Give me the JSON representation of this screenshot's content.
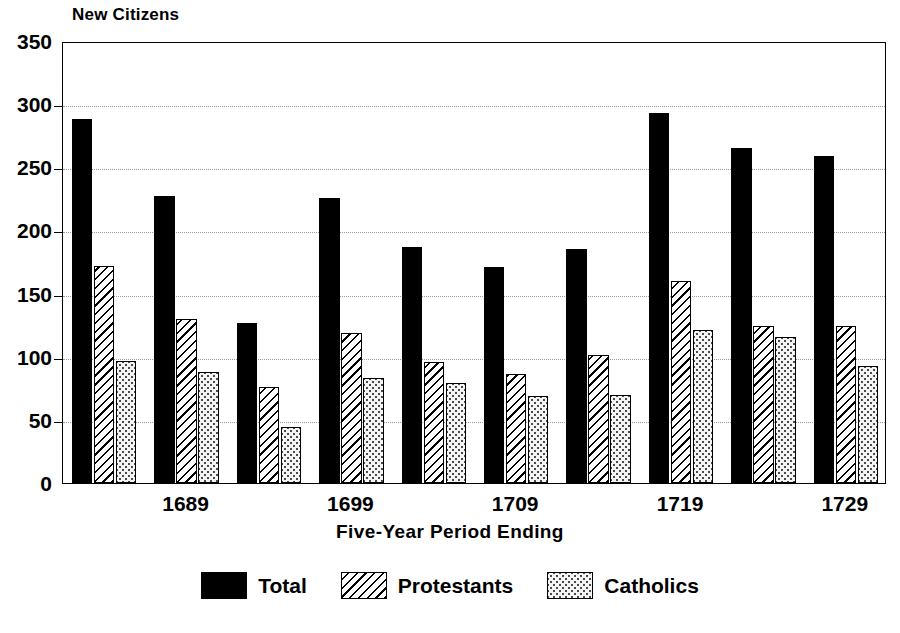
{
  "chart_data": {
    "type": "bar",
    "title": "New Citizens",
    "subtitle": "",
    "xlabel": "Five-Year Period Ending",
    "ylabel": "New Citizens",
    "ylim": [
      0,
      350
    ],
    "yticks": [
      0,
      50,
      100,
      150,
      200,
      250,
      300,
      350
    ],
    "ytick_labels": [
      "0",
      "50",
      "100",
      "150",
      "200",
      "250",
      "300",
      "350"
    ],
    "grid": true,
    "legend_position": "bottom",
    "categories": [
      "",
      "1689",
      "",
      "1699",
      "",
      "1709",
      "",
      "1719",
      "",
      "1729"
    ],
    "xtick_labels": [
      "1689",
      "1699",
      "1709",
      "1719",
      "1729"
    ],
    "xtick_group_index": [
      1,
      3,
      5,
      7,
      9
    ],
    "series": [
      {
        "name": "Total",
        "pattern": "solid-black",
        "color": "#000000",
        "values": [
          288,
          227,
          127,
          226,
          187,
          171,
          185,
          293,
          265,
          259
        ]
      },
      {
        "name": "Protestants",
        "pattern": "diagonal-hatch",
        "color": "#000000",
        "values": [
          172,
          130,
          76,
          119,
          96,
          86,
          101,
          160,
          124,
          124
        ]
      },
      {
        "name": "Catholics",
        "pattern": "stipple-dots",
        "color": "#4a4a4a",
        "values": [
          97,
          88,
          44,
          83,
          79,
          69,
          70,
          121,
          116,
          93
        ]
      }
    ]
  },
  "legend": {
    "items": [
      {
        "label": "Total"
      },
      {
        "label": "Protestants"
      },
      {
        "label": "Catholics"
      }
    ]
  }
}
